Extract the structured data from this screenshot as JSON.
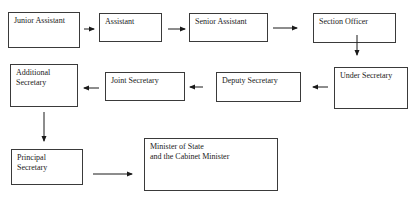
{
  "diagram": {
    "type": "flowchart",
    "nodes": [
      {
        "id": "junior-assistant",
        "label": "Junior Assistant"
      },
      {
        "id": "assistant",
        "label": "Assistant"
      },
      {
        "id": "senior-assistant",
        "label": "Senior Assistant"
      },
      {
        "id": "section-officer",
        "label": "Section Officer"
      },
      {
        "id": "under-secretary",
        "label": "Under Secretary"
      },
      {
        "id": "deputy-secretary",
        "label": "Deputy Secretary"
      },
      {
        "id": "joint-secretary",
        "label": "Joint Secretary"
      },
      {
        "id": "additional-secretary",
        "label": "Additional\nSecretary"
      },
      {
        "id": "principal-secretary",
        "label": "Principal Secretary"
      },
      {
        "id": "minister",
        "label": "Minister of State\nand the Cabinet Minister"
      }
    ],
    "edges": [
      {
        "from": "junior-assistant",
        "to": "assistant",
        "direction": "right"
      },
      {
        "from": "assistant",
        "to": "senior-assistant",
        "direction": "right"
      },
      {
        "from": "senior-assistant",
        "to": "section-officer",
        "direction": "right"
      },
      {
        "from": "section-officer",
        "to": "under-secretary",
        "direction": "down"
      },
      {
        "from": "under-secretary",
        "to": "deputy-secretary",
        "direction": "left"
      },
      {
        "from": "deputy-secretary",
        "to": "joint-secretary",
        "direction": "left"
      },
      {
        "from": "joint-secretary",
        "to": "additional-secretary",
        "direction": "left"
      },
      {
        "from": "additional-secretary",
        "to": "principal-secretary",
        "direction": "down"
      },
      {
        "from": "principal-secretary",
        "to": "minister",
        "direction": "right"
      }
    ],
    "colors": {
      "border": "#3a3a3a",
      "text": "#1a1a1a",
      "background": "#ffffff"
    }
  }
}
